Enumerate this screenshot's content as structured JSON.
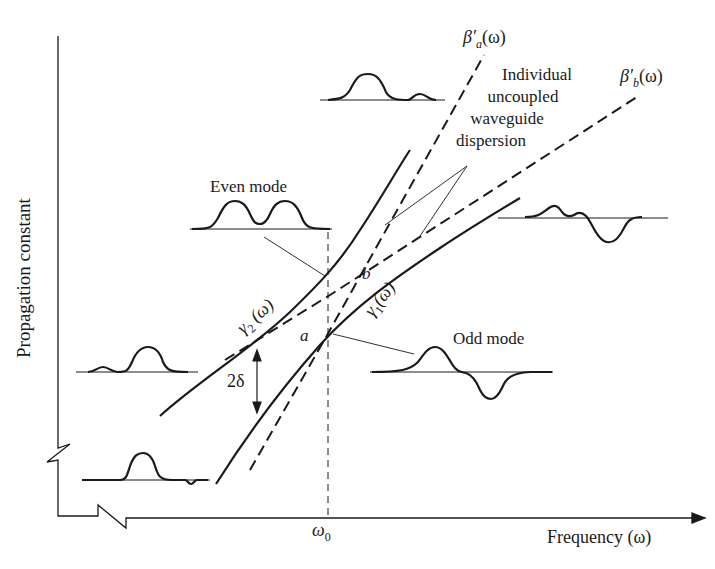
{
  "figure": {
    "y_axis_label": "Propagation constant",
    "x_axis_label": "Frequency (ω)",
    "x_tick": "ω0",
    "x_tick_main": "ω",
    "x_tick_sub": "0",
    "curve_labels": {
      "beta_a": {
        "main": "β′",
        "sub": "a",
        "arg": "(ω)"
      },
      "beta_b": {
        "main": "β′",
        "sub": "b",
        "arg": "(ω)"
      },
      "gamma_2": {
        "main": "γ",
        "sub": "2",
        "arg": " (ω)"
      },
      "gamma_1": {
        "main": "γ",
        "sub": "1",
        "arg": "(ω)"
      }
    },
    "point_labels": {
      "a": "a",
      "b": "b"
    },
    "gap_label": "2δ",
    "annotations": {
      "uncoupled_line1": "Individual",
      "uncoupled_line2": "uncoupled",
      "uncoupled_line3": "waveguide",
      "uncoupled_line4": "dispersion",
      "even_mode": "Even mode",
      "odd_mode": "Odd mode"
    },
    "colors": {
      "ink": "#1a1a1a",
      "background": "#ffffff"
    }
  }
}
